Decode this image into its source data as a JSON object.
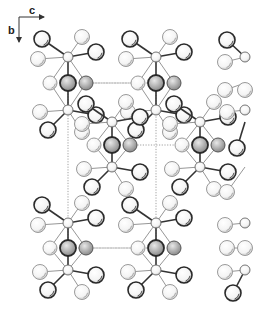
{
  "figure": {
    "type": "crystal-structure-projection",
    "axes": {
      "horizontal_label": "c",
      "vertical_label": "b"
    },
    "unit_cell": {
      "style": "dotted",
      "x0": 68,
      "y0": 83,
      "x1": 156,
      "y1": 248
    },
    "motifs": [
      {
        "cx": 68,
        "cy": 83,
        "top": 57,
        "bottom": 110,
        "full": true
      },
      {
        "cx": 156,
        "cy": 83,
        "top": 57,
        "bottom": 110,
        "full": true
      },
      {
        "cx": 112,
        "cy": 145,
        "top": 122,
        "bottom": 167,
        "full": true
      },
      {
        "cx": 200,
        "cy": 145,
        "top": 122,
        "bottom": 167,
        "full": true
      },
      {
        "cx": 68,
        "cy": 248,
        "top": 223,
        "bottom": 270,
        "full": true
      },
      {
        "cx": 156,
        "cy": 248,
        "top": 223,
        "bottom": 270,
        "full": true
      }
    ],
    "partial_column": {
      "x": 245,
      "nodes": [
        40,
        83,
        122,
        167,
        225,
        268
      ]
    },
    "colors": {
      "dark_atom": "#2a2a2a",
      "light_atom": "#9a9a9a",
      "bond_dark": "#333333",
      "bond_light": "#8a8a8a",
      "cell": "#888888"
    }
  }
}
